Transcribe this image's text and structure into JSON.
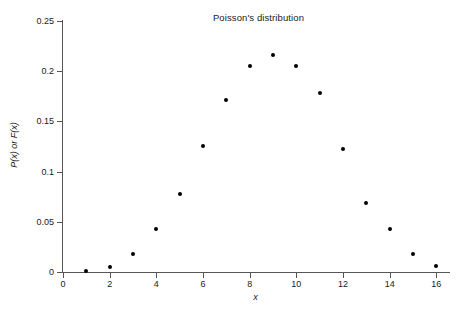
{
  "chart_data": {
    "type": "scatter",
    "title": "Poisson's distribution",
    "xlabel": "x",
    "ylabel": "P(x) or F(x)",
    "xlim": [
      0,
      16.5
    ],
    "ylim": [
      0,
      0.25
    ],
    "grid": false,
    "legend": null,
    "x_ticks": [
      "0",
      "2",
      "4",
      "6",
      "8",
      "10",
      "12",
      "14",
      "16"
    ],
    "x_tick_values": [
      0,
      2,
      4,
      6,
      8,
      10,
      12,
      14,
      16
    ],
    "y_ticks": [
      "0",
      "0.05",
      "0.1",
      "0.15",
      "0.2",
      "0.25"
    ],
    "y_tick_values": [
      0,
      0.05,
      0.1,
      0.15,
      0.2,
      0.25
    ],
    "x": [
      1,
      2,
      3,
      4,
      5,
      6,
      7,
      8,
      9,
      10,
      11,
      12,
      13,
      14,
      15,
      16
    ],
    "values": [
      0.0011,
      0.005,
      0.0181,
      0.0429,
      0.0779,
      0.1258,
      0.1712,
      0.2047,
      0.2159,
      0.2047,
      0.1778,
      0.1221,
      0.0692,
      0.0427,
      0.0181,
      0.0055
    ],
    "series": [
      {
        "name": "P(x)",
        "marker": "filled-circle",
        "color": "#000000",
        "points": [
          {
            "x": 1,
            "y": 0.0011
          },
          {
            "x": 2,
            "y": 0.005
          },
          {
            "x": 3,
            "y": 0.0181
          },
          {
            "x": 4,
            "y": 0.0429
          },
          {
            "x": 5,
            "y": 0.0779
          },
          {
            "x": 6,
            "y": 0.1258
          },
          {
            "x": 7,
            "y": 0.1712
          },
          {
            "x": 8,
            "y": 0.2047
          },
          {
            "x": 9,
            "y": 0.2159
          },
          {
            "x": 10,
            "y": 0.2047
          },
          {
            "x": 11,
            "y": 0.1778
          },
          {
            "x": 12,
            "y": 0.1221
          },
          {
            "x": 13,
            "y": 0.0692
          },
          {
            "x": 14,
            "y": 0.0427
          },
          {
            "x": 15,
            "y": 0.0181
          },
          {
            "x": 16,
            "y": 0.0055
          }
        ]
      }
    ]
  },
  "colors": {
    "axis": "#555555",
    "marker": "#000000",
    "text": "#1a1a1a",
    "background": "#ffffff"
  }
}
